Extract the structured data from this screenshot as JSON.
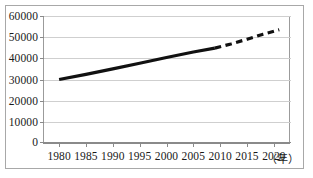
{
  "chart_data": {
    "type": "line",
    "title": "",
    "subtitle": "",
    "xlabel": "（年）",
    "ylabel": "",
    "grid": true,
    "legend": "none",
    "xlim": [
      1977,
      2023
    ],
    "ylim": [
      0,
      60000
    ],
    "x_tick_labels": [
      "1980",
      "1985",
      "1990",
      "1995",
      "2000",
      "2005",
      "2010",
      "2015",
      "2020"
    ],
    "x_ticks": [
      1980,
      1985,
      1990,
      1995,
      2000,
      2005,
      2010,
      2015,
      2020
    ],
    "y_tick_labels": [
      "0",
      "10000",
      "20000",
      "30000",
      "40000",
      "50000",
      "60000"
    ],
    "y_ticks": [
      0,
      10000,
      20000,
      30000,
      40000,
      50000,
      60000
    ],
    "series": [
      {
        "name": "actual",
        "style": "solid",
        "color": "#111111",
        "x": [
          1980,
          1985,
          1990,
          1995,
          2000,
          2005,
          2009
        ],
        "values": [
          30000,
          32400,
          35000,
          37700,
          40400,
          43000,
          44800
        ]
      },
      {
        "name": "projected",
        "style": "dashed",
        "color": "#111111",
        "x": [
          2009,
          2012,
          2015,
          2018,
          2021
        ],
        "values": [
          44800,
          46800,
          49000,
          51400,
          53500
        ]
      }
    ],
    "annotations": []
  },
  "figure": {
    "x_unit_label": "（年）",
    "frame": true
  },
  "accessibility": {
    "chart_description": "Line chart of values from 1980 to 2020; a thick solid black line rises from 30000 in 1980 to about 44800 around 2009, then continues as a dashed projection to about 53500 by 2021."
  }
}
